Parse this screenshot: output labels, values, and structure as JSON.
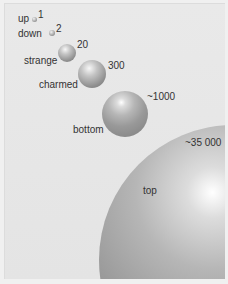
{
  "figure": {
    "title": "",
    "background_color": "#e6e6e6",
    "quarks": [
      {
        "name": "up",
        "mass": "1"
      },
      {
        "name": "down",
        "mass": "2"
      },
      {
        "name": "strange",
        "mass": "20"
      },
      {
        "name": "charmed",
        "mass": "300"
      },
      {
        "name": "bottom",
        "mass": "~1000"
      },
      {
        "name": "top",
        "mass": "~35 000"
      }
    ]
  }
}
